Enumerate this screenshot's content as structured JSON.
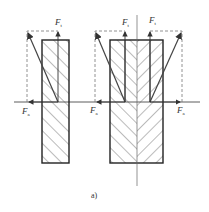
{
  "figure": {
    "caption": "a)",
    "labels": {
      "ft_left": {
        "main": "F",
        "sub": "t"
      },
      "ft_mid": {
        "main": "F",
        "sub": "t"
      },
      "ft_right": {
        "main": "F",
        "sub": "t"
      },
      "fa_left": {
        "main": "F",
        "sub": "a"
      },
      "fa_mid": {
        "main": "F",
        "sub": "a"
      },
      "fa_right": {
        "main": "F",
        "sub": "a"
      }
    },
    "colors": {
      "line": "#333333",
      "dashed": "#777777",
      "hatch": "#555555",
      "background": "#ffffff"
    }
  }
}
